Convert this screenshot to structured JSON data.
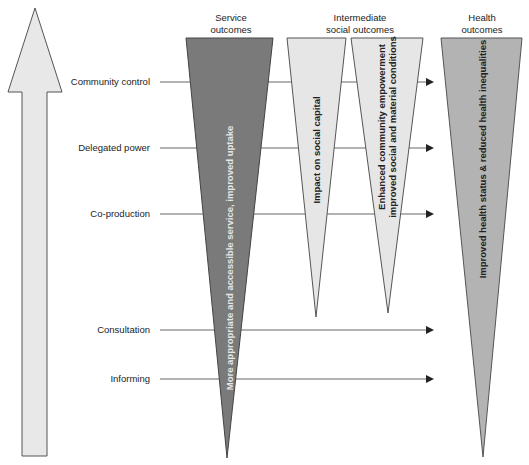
{
  "diagram": {
    "type": "participation-ladder-outcomes",
    "axis_arrow": {
      "direction": "up",
      "fill": "#e8e8e8",
      "stroke": "#555555"
    },
    "levels": [
      {
        "label": "Community control",
        "y": 82,
        "arrow_to": 434
      },
      {
        "label": "Delegated power",
        "y": 148,
        "arrow_to": null
      },
      {
        "label": "Co-production",
        "y": 214,
        "arrow_to": 434
      },
      {
        "label": "Consultation",
        "y": 330,
        "arrow_to": 434
      },
      {
        "label": "Informing",
        "y": 379,
        "arrow_to": 434
      }
    ],
    "column_headers": {
      "service": [
        "Service",
        "outcomes"
      ],
      "intermediate": [
        "Intermediate",
        "social outcomes"
      ],
      "health": [
        "Health",
        "outcomes"
      ]
    },
    "wedges": [
      {
        "id": "service",
        "text": "More appropriate and accessible service, improved uptake",
        "fill": "#7a7a7a",
        "text_color": "#e6e6e6"
      },
      {
        "id": "social-capital",
        "text": "Impact on social capital",
        "fill": "#e6e6e6",
        "text_color": "#222222"
      },
      {
        "id": "empowerment",
        "text_line1": "Enhanced community empowerment",
        "text_line2": "improved social and material conditions",
        "fill": "#e6e6e6",
        "text_color": "#222222"
      },
      {
        "id": "health",
        "text": "Improved health status & reduced health inequalities",
        "fill": "#b3b3b3",
        "text_color": "#222222"
      }
    ]
  }
}
